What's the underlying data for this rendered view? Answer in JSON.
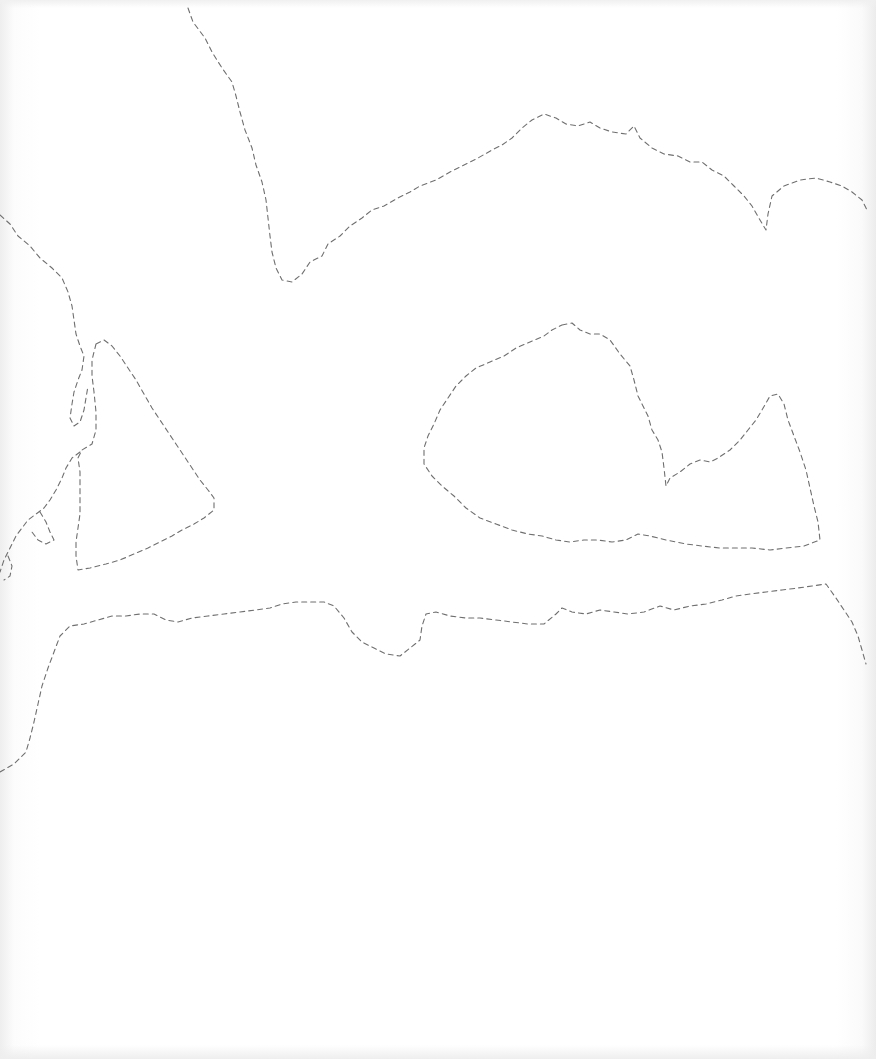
{
  "page": {
    "background": "#ffffff",
    "line_color": "#6f6f6f",
    "line_style": "dashed"
  },
  "outlines": [
    {
      "id": "diagonal-ridge-line",
      "closed": false
    },
    {
      "id": "left-coast-line",
      "closed": false
    },
    {
      "id": "left-triangle-shape",
      "closed": true
    },
    {
      "id": "left-small-loop",
      "closed": false
    },
    {
      "id": "center-right-blob-shape",
      "closed": true
    },
    {
      "id": "lower-horizon-line",
      "closed": false
    }
  ]
}
